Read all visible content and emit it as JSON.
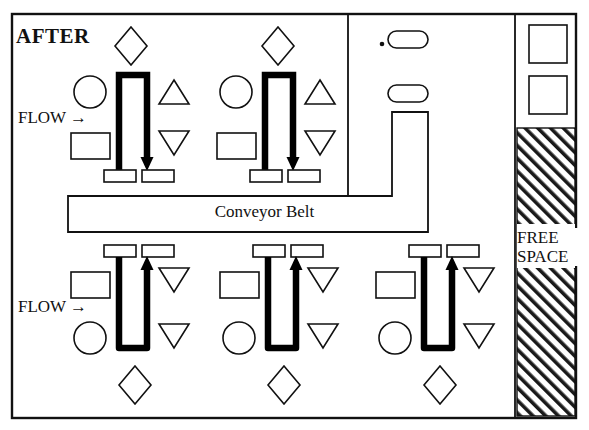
{
  "diagram": {
    "title": "AFTER",
    "conveyor_label": "Conveyor Belt",
    "free_space_line1": "FREE",
    "free_space_line2": "SPACE",
    "flow_label_top": "FLOW →",
    "flow_label_bottom": "FLOW →",
    "line_color": "#111111",
    "fill_color": "#ffffff",
    "machine_color": "#000000"
  },
  "layout": {
    "border": {
      "x": 12,
      "y": 14,
      "w": 564,
      "h": 404
    },
    "dividers": [
      {
        "name": "vertical-divider-upper",
        "x1": 348,
        "y1": 14,
        "x2": 348,
        "y2": 196
      },
      {
        "name": "vertical-divider-right",
        "x1": 515,
        "y1": 14,
        "x2": 515,
        "y2": 418
      }
    ],
    "conveyor": {
      "x": 68,
      "y": 196,
      "w": 360,
      "h": 36
    },
    "conveyor_riser": {
      "x": 392,
      "y": 112,
      "w": 36,
      "h": 84
    },
    "free_space_hatch": {
      "x": 517,
      "y": 128,
      "w": 58,
      "h": 288
    }
  },
  "cells": {
    "top_row": [
      {
        "name": "workcell-top-1",
        "flow_label": "FLOW →",
        "machine_orientation": "down",
        "shapes": [
          "diamond",
          "circle",
          "rectangle",
          "triangle-up",
          "triangle-down"
        ]
      },
      {
        "name": "workcell-top-2",
        "flow_label": "",
        "machine_orientation": "down",
        "shapes": [
          "diamond",
          "circle",
          "rectangle",
          "triangle-up",
          "triangle-down"
        ]
      }
    ],
    "bottom_row": [
      {
        "name": "workcell-bottom-1",
        "flow_label": "FLOW →",
        "machine_orientation": "up",
        "shapes": [
          "rectangle",
          "circle",
          "triangle-down",
          "triangle-down",
          "diamond"
        ]
      },
      {
        "name": "workcell-bottom-2",
        "flow_label": "",
        "machine_orientation": "up",
        "shapes": [
          "rectangle",
          "circle",
          "triangle-down",
          "triangle-down",
          "diamond"
        ]
      },
      {
        "name": "workcell-bottom-3",
        "flow_label": "",
        "machine_orientation": "up",
        "shapes": [
          "rectangle",
          "circle",
          "triangle-down",
          "triangle-down",
          "diamond"
        ]
      }
    ]
  },
  "misc": {
    "pill_top": "pill-shape",
    "pill_bottom": "pill-shape",
    "dot": "small-dot",
    "square_top": "square-station",
    "square_bottom": "square-station"
  }
}
